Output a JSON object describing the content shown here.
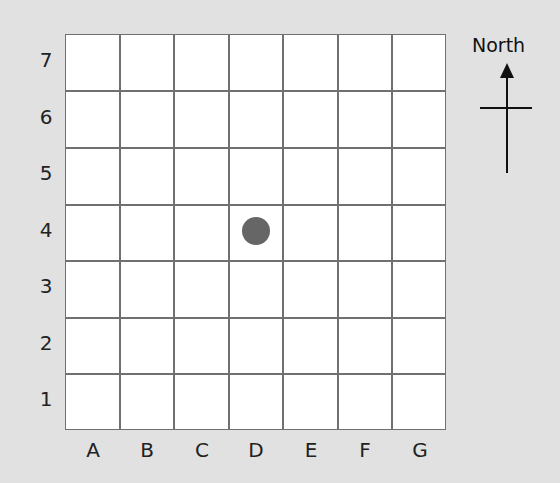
{
  "grid": {
    "columns": [
      "A",
      "B",
      "C",
      "D",
      "E",
      "F",
      "G"
    ],
    "rows": [
      "7",
      "6",
      "5",
      "4",
      "3",
      "2",
      "1"
    ],
    "background": "#ffffff",
    "line_color": "#707070"
  },
  "marker": {
    "column": "D",
    "row": "4",
    "color": "#666666"
  },
  "compass": {
    "label": "North"
  },
  "page": {
    "background": "#e1e1e1"
  }
}
